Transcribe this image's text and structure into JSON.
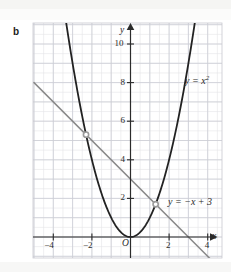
{
  "figure": {
    "part_label": "b",
    "axis_x_name": "x",
    "axis_y_name": "y",
    "origin_label": "O",
    "curve_label_parabola": "y = x",
    "curve_label_parabola_exp": "2",
    "curve_label_line": "y = −x + 3",
    "colors": {
      "grid_minor": "#e2e2e6",
      "grid_major": "#c9c9d0",
      "axis": "#2b2b2b",
      "parabola": "#222222",
      "line": "#8a8a8a",
      "intersection_dot": "#9a9a9a",
      "page": "#ffffff"
    }
  },
  "chart_data": {
    "type": "line",
    "title": "",
    "xlabel": "x",
    "ylabel": "y",
    "xlim": [
      -5.0,
      4.8
    ],
    "ylim": [
      -1.2,
      11.0
    ],
    "grid": true,
    "grid_minor_step": 0.5,
    "grid_major_step": 1,
    "legend": "inline-annotations",
    "xticks": [
      -4,
      -2,
      2,
      4
    ],
    "xtick_labels": [
      "−4",
      "−2",
      "2",
      "4"
    ],
    "yticks": [
      2,
      4,
      6,
      8,
      10
    ],
    "ytick_labels": [
      "2",
      "4",
      "6",
      "8",
      "10"
    ],
    "series": [
      {
        "name": "y = x^2",
        "type": "parabola",
        "equation": "y = x^2",
        "color": "#222222",
        "a": 1,
        "b": 0,
        "c": 0,
        "x_range": [
          -3.32,
          3.32
        ],
        "points": [
          {
            "x": -3.3,
            "y": 10.89
          },
          {
            "x": -3.0,
            "y": 9.0
          },
          {
            "x": -2.5,
            "y": 6.25
          },
          {
            "x": -2.0,
            "y": 4.0
          },
          {
            "x": -1.5,
            "y": 2.25
          },
          {
            "x": -1.0,
            "y": 1.0
          },
          {
            "x": -0.5,
            "y": 0.25
          },
          {
            "x": 0.0,
            "y": 0.0
          },
          {
            "x": 0.5,
            "y": 0.25
          },
          {
            "x": 1.0,
            "y": 1.0
          },
          {
            "x": 1.5,
            "y": 2.25
          },
          {
            "x": 2.0,
            "y": 4.0
          },
          {
            "x": 2.5,
            "y": 6.25
          },
          {
            "x": 3.0,
            "y": 9.0
          },
          {
            "x": 3.3,
            "y": 10.89
          }
        ]
      },
      {
        "name": "y = -x + 3",
        "type": "line",
        "equation": "y = -x + 3",
        "color": "#8a8a8a",
        "slope": -1,
        "intercept": 3,
        "x_range": [
          -5.0,
          4.4
        ],
        "points": [
          {
            "x": -5.0,
            "y": 8.0
          },
          {
            "x": 4.4,
            "y": -1.4
          }
        ]
      }
    ],
    "intersections": [
      {
        "x": -2.303,
        "y": 5.303
      },
      {
        "x": 1.303,
        "y": 1.697
      }
    ],
    "annotations": [
      {
        "text": "y = x²",
        "x": 3.0,
        "y": 8.2
      },
      {
        "text": "y = −x + 3",
        "x": 2.1,
        "y": 1.6
      }
    ]
  }
}
